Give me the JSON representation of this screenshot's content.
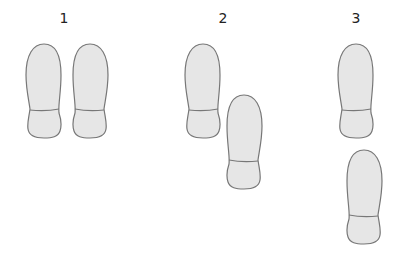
{
  "diagram": {
    "title": "",
    "groups": [
      {
        "label": "1",
        "label_x": 54,
        "feet": [
          {
            "side": "left",
            "x": 25,
            "y": 43,
            "flip": false
          },
          {
            "side": "right",
            "x": 72,
            "y": 43,
            "flip": true
          }
        ]
      },
      {
        "label": "2",
        "label_x": 213,
        "feet": [
          {
            "side": "left",
            "x": 184,
            "y": 43,
            "flip": false
          },
          {
            "side": "right",
            "x": 226,
            "y": 94,
            "flip": true
          }
        ]
      },
      {
        "label": "3",
        "label_x": 346,
        "feet": [
          {
            "side": "left",
            "x": 338,
            "y": 43,
            "flip": false
          },
          {
            "side": "right",
            "x": 346,
            "y": 149,
            "flip": true
          }
        ]
      }
    ],
    "colors": {
      "fill": "#e6e6e6",
      "stroke": "#777777",
      "label": "#222222"
    }
  }
}
